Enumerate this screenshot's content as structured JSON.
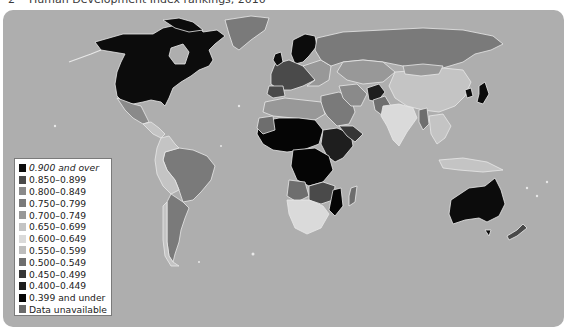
{
  "title": {
    "number": "2",
    "text": "Human Development Index rankings, 2010"
  },
  "map": {
    "ocean_color": "#aeaeae",
    "border_color": "#e6e6e6",
    "regions": [
      {
        "name": "Canada",
        "class": "0.900 and over"
      },
      {
        "name": "United States",
        "class": "0.900 and over"
      },
      {
        "name": "Greenland",
        "class": "0.750-0.799"
      },
      {
        "name": "Mexico",
        "class": "0.750-0.799"
      },
      {
        "name": "Central America",
        "class": "0.650-0.699"
      },
      {
        "name": "Brazil",
        "class": "0.750-0.799"
      },
      {
        "name": "Argentina",
        "class": "0.750-0.799"
      },
      {
        "name": "Andean South America",
        "class": "0.650-0.699"
      },
      {
        "name": "Russia",
        "class": "0.750-0.799"
      },
      {
        "name": "China",
        "class": "0.650-0.699"
      },
      {
        "name": "India",
        "class": "0.600-0.649"
      },
      {
        "name": "Scandinavia",
        "class": "0.900 and over"
      },
      {
        "name": "Western Europe",
        "class": "0.850-0.899"
      },
      {
        "name": "Japan",
        "class": "0.900 and over"
      },
      {
        "name": "Australia",
        "class": "0.900 and over"
      },
      {
        "name": "New Zealand",
        "class": "0.850-0.899"
      },
      {
        "name": "Sahel and Central Africa",
        "class": "0.399 and under"
      },
      {
        "name": "South Africa",
        "class": "0.600-0.649"
      },
      {
        "name": "Madagascar",
        "class": "0.500-0.549"
      },
      {
        "name": "Middle East",
        "class": "0.750-0.799"
      },
      {
        "name": "Afghanistan",
        "class": "0.400-0.449"
      },
      {
        "name": "Southeast Asia",
        "class": "0.650-0.699"
      }
    ]
  },
  "legend": {
    "items": [
      {
        "label": "0.900 and over",
        "color": "#0c0c0c"
      },
      {
        "label": "0.850–0.899",
        "color": "#4a4a4a"
      },
      {
        "label": "0.800–0.849",
        "color": "#8a8a8a"
      },
      {
        "label": "0.750–0.799",
        "color": "#7a7a7a"
      },
      {
        "label": "0.700–0.749",
        "color": "#989898"
      },
      {
        "label": "0.650–0.699",
        "color": "#c4c4c4"
      },
      {
        "label": "0.600–0.649",
        "color": "#dadada"
      },
      {
        "label": "0.550–0.599",
        "color": "#bdbdbd"
      },
      {
        "label": "0.500–0.549",
        "color": "#6e6e6e"
      },
      {
        "label": "0.450–0.499",
        "color": "#363636"
      },
      {
        "label": "0.400–0.449",
        "color": "#1e1e1e"
      },
      {
        "label": "0.399 and under",
        "color": "#050505"
      },
      {
        "label": "Data unavailable",
        "color": "#6a6a6a"
      }
    ]
  }
}
